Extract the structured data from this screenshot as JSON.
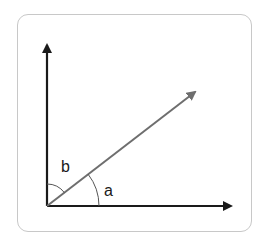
{
  "diagram": {
    "type": "angle-diagram",
    "axes": {
      "vertical": {
        "name": "vertical-axis",
        "color": "#1a1a1a"
      },
      "horizontal": {
        "name": "horizontal-axis",
        "color": "#1a1a1a"
      }
    },
    "ray": {
      "name": "diagonal-ray",
      "color": "#6e6e6e"
    },
    "angles": [
      {
        "id": "a",
        "label": "a",
        "between": "horizontal-axis and diagonal-ray"
      },
      {
        "id": "b",
        "label": "b",
        "between": "vertical-axis and diagonal-ray"
      }
    ],
    "colors": {
      "axis": "#1a1a1a",
      "ray": "#6e6e6e",
      "arc": "#555555",
      "card_border": "#c8c8c8"
    }
  }
}
